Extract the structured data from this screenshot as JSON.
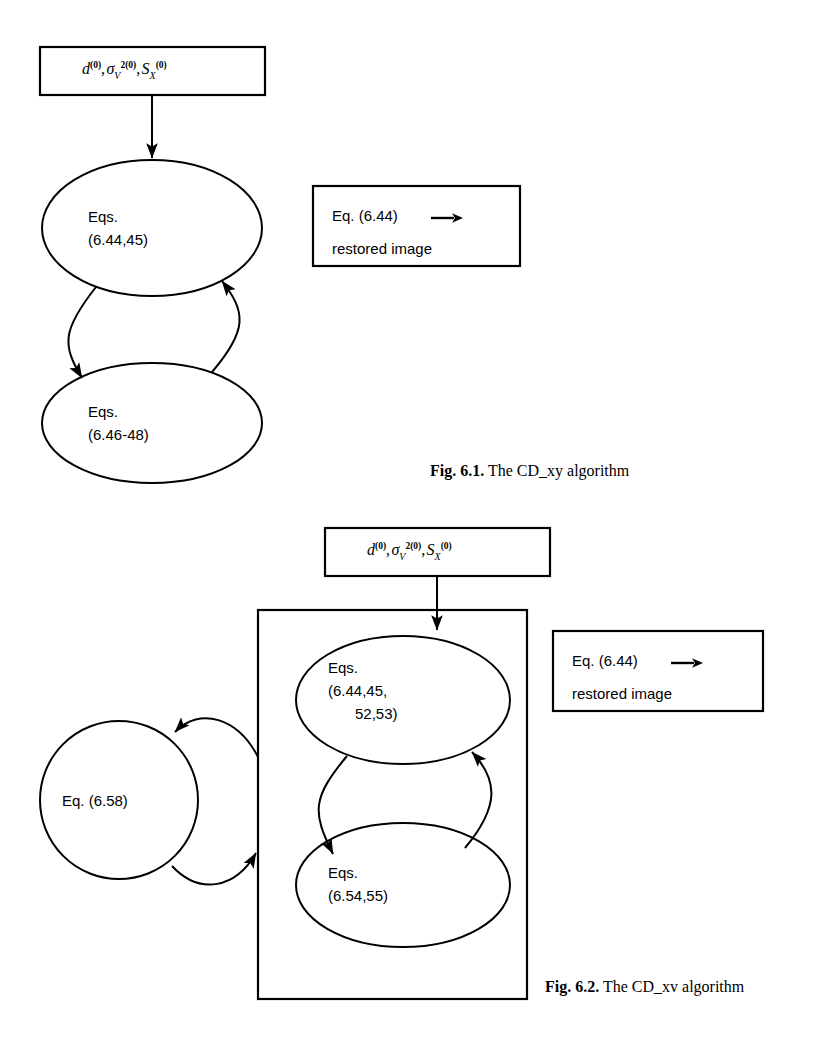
{
  "figures": [
    {
      "id": "fig-6-1",
      "caption_prefix": "Fig. 6.1.",
      "caption_text": " The CD_xy algorithm",
      "input_box": {
        "symbols": [
          "d",
          "σ",
          "S"
        ],
        "plain": "d(0), σV2(0), SX(0)"
      },
      "nodes": [
        {
          "name": "eqs-6-44-45",
          "lines": [
            "Eqs.",
            "(6.44,45)"
          ]
        },
        {
          "name": "eqs-6-46-48",
          "lines": [
            "Eqs.",
            "(6.46-48)"
          ]
        }
      ],
      "output_box": {
        "line1": "Eq. (6.44)",
        "arrow": "right-arrow-icon",
        "line2": "restored image"
      }
    },
    {
      "id": "fig-6-2",
      "caption_prefix": "Fig. 6.2.",
      "caption_text": " The CD_xv algorithm",
      "input_box": {
        "symbols": [
          "d",
          "σ",
          "S"
        ],
        "plain": "d(0), σV2(0), SX(0)"
      },
      "nodes": [
        {
          "name": "eq-6-58",
          "lines": [
            "Eq. (6.58)"
          ]
        },
        {
          "name": "eqs-6-44-45-52-53",
          "lines": [
            "Eqs.",
            "(6.44,45,",
            "52,53)"
          ]
        },
        {
          "name": "eqs-6-54-55",
          "lines": [
            "Eqs.",
            "(6.54,55)"
          ]
        }
      ],
      "output_box": {
        "line1": "Eq. (6.44)",
        "arrow": "right-arrow-icon",
        "line2": "restored image"
      }
    }
  ],
  "colors": {
    "stroke": "#000000",
    "background": "#ffffff"
  }
}
